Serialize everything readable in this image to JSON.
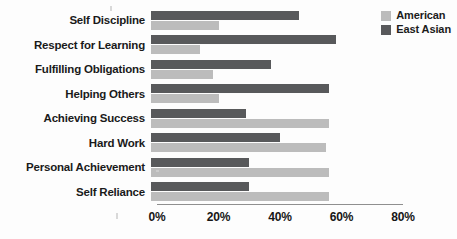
{
  "chart_data": {
    "type": "bar",
    "orientation": "horizontal",
    "title": "",
    "subtitle": "",
    "xlabel": "",
    "ylabel": "",
    "xlim": [
      0,
      80
    ],
    "grid": false,
    "legend_position": "top-right",
    "tick_labels": [
      "0%",
      "20%",
      "40%",
      "60%",
      "80%"
    ],
    "tick_values": [
      0,
      20,
      40,
      60,
      80
    ],
    "categories": [
      "Self Discipline",
      "Respect for Learning",
      "Fulfilling Obligations",
      "Helping Others",
      "Achieving Success",
      "Hard Work",
      "Personal Achievement",
      "Self Reliance"
    ],
    "series": [
      {
        "name": "East Asian",
        "color": "#58595b",
        "values": [
          48,
          60,
          39,
          58,
          31,
          42,
          32,
          32
        ]
      },
      {
        "name": "American",
        "color": "#bcbcbc",
        "values": [
          22,
          16,
          20,
          22,
          58,
          57,
          58,
          58
        ]
      }
    ]
  },
  "legend": {
    "items": [
      {
        "label": "American",
        "color": "#bcbcbc"
      },
      {
        "label": "East Asian",
        "color": "#58595b"
      }
    ]
  }
}
